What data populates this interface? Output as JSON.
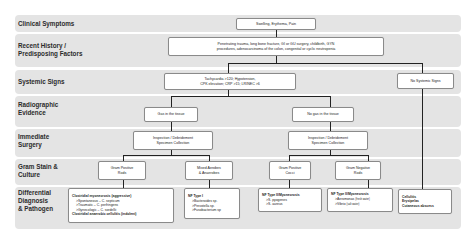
{
  "rows": [
    {
      "label": "Clinical Symptoms"
    },
    {
      "label": "Recent History /\nPredisposing Factors"
    },
    {
      "label": "Systemic Signs"
    },
    {
      "label": "Radiographic\nEvidence"
    },
    {
      "label": "Immediate\nSurgery"
    },
    {
      "label": "Gram Stain &\nCulture"
    },
    {
      "label": "Differential\nDiagnosis\n& Pathogen"
    }
  ],
  "nodes": {
    "symptoms": "Swelling, Erythema, Pain",
    "history_line1": "Penetrating trauma, long bone fracture, GI or GU surgery, childbirth, GYN",
    "history_line2": "procedures, adenocarcinoma of the colon, congenital or cyclic neutropenia",
    "systemic_line1": "Tachycardia >120;  Hypotension,",
    "systemic_line2": "CPK elevation; CRP >15; LRINEC >6",
    "no_systemic": "No Systemic Signs",
    "gas": "Gas in the tissue",
    "no_gas": "No gas in the tissue",
    "surgery_left_line1": "Inspection / Debridement",
    "surgery_left_line2": "Specimen Collection",
    "surgery_right_line1": "Inspection / Debridement",
    "surgery_right_line2": "Specimen Collection",
    "gpr_line1": "Gram Positive",
    "gpr_line2": "Rods",
    "mixed_line1": "Mixed Aerobes",
    "mixed_line2": "& Anaerobes",
    "gpc_line1": "Gram Positive",
    "gpc_line2": "Cocci",
    "gnr_line1": "Gram Negative",
    "gnr_line2": "Rods"
  },
  "diagnoses": {
    "clostridial": {
      "title": "Clostridial myonecrosis (aggressive)",
      "items": [
        ">Spontaneous – C. septicum",
        ">Traumatic – C. perfringens",
        ">Gynecologic – C. sordellii"
      ],
      "footer": "Clostridial anaerobic cellulitis (indolent)"
    },
    "nf1": {
      "title": "NF Type I",
      "items": [
        ">Bacteroides sp.",
        ">Prevotella sp.",
        ">Fusobacterium sp"
      ]
    },
    "nf2_gpc": {
      "title": "NF Type II/Myonecrosis",
      "items": [
        ">S. pyogenes",
        ">S. aureus"
      ]
    },
    "nf2_gnr": {
      "title": "NF Type II/Myonecrosis",
      "items": [
        ">Aeromonas",
        ">Vibrio"
      ],
      "notes": [
        "(fresh water)",
        "(salt water)"
      ]
    },
    "superficial": {
      "items": [
        "Cellulitis",
        "Erysipelas",
        "Cutaneous abscess"
      ]
    }
  },
  "colors": {
    "band": "#e4e4e4",
    "box_border": "#8a8a8a",
    "line": "#222222"
  }
}
